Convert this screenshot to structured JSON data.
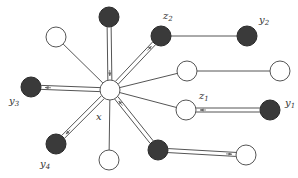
{
  "diagram": {
    "type": "graph",
    "colors": {
      "filled_node": "#3a3a3a",
      "empty_node_fill": "#ffffff",
      "stroke": "#555555",
      "arrow": "#666666"
    },
    "nodes": [
      {
        "id": "x",
        "label": "x",
        "filled": false,
        "cx": 110,
        "cy": 90
      },
      {
        "id": "top-left",
        "label": "",
        "filled": false,
        "cx": 56,
        "cy": 37
      },
      {
        "id": "top",
        "label": "",
        "filled": true,
        "cx": 109,
        "cy": 17
      },
      {
        "id": "z2",
        "label": "z2",
        "filled": true,
        "cx": 161,
        "cy": 36
      },
      {
        "id": "y2",
        "label": "y2",
        "filled": true,
        "cx": 247,
        "cy": 36
      },
      {
        "id": "mid-right",
        "label": "",
        "filled": false,
        "cx": 187,
        "cy": 71
      },
      {
        "id": "far-right",
        "label": "",
        "filled": false,
        "cx": 280,
        "cy": 71
      },
      {
        "id": "z1",
        "label": "z1",
        "filled": false,
        "cx": 186,
        "cy": 110
      },
      {
        "id": "y1",
        "label": "y1",
        "filled": true,
        "cx": 270,
        "cy": 110
      },
      {
        "id": "y3",
        "label": "y3",
        "filled": true,
        "cx": 31,
        "cy": 87
      },
      {
        "id": "y4",
        "label": "y4",
        "filled": true,
        "cx": 56,
        "cy": 144
      },
      {
        "id": "bottom",
        "label": "",
        "filled": false,
        "cx": 109,
        "cy": 160
      },
      {
        "id": "bottom-right",
        "label": "",
        "filled": true,
        "cx": 158,
        "cy": 150
      },
      {
        "id": "bottom-far",
        "label": "",
        "filled": false,
        "cx": 246,
        "cy": 155
      }
    ],
    "edges": [
      {
        "from": "x",
        "to": "top-left",
        "double": false
      },
      {
        "from": "top",
        "to": "x",
        "double": true,
        "arrow": "to-x"
      },
      {
        "from": "x",
        "to": "z2",
        "double": true,
        "arrow": "to-z2"
      },
      {
        "from": "z2",
        "to": "y2",
        "double": false
      },
      {
        "from": "x",
        "to": "mid-right",
        "double": false
      },
      {
        "from": "mid-right",
        "to": "far-right",
        "double": false
      },
      {
        "from": "x",
        "to": "z1",
        "double": false
      },
      {
        "from": "y1",
        "to": "z1",
        "double": true,
        "arrow": "to-z1"
      },
      {
        "from": "x",
        "to": "y3",
        "double": true,
        "arrow": "to-y3"
      },
      {
        "from": "x",
        "to": "y4",
        "double": true,
        "arrow": "to-y4"
      },
      {
        "from": "x",
        "to": "bottom",
        "double": false
      },
      {
        "from": "bottom-right",
        "to": "x",
        "double": true,
        "arrow": "to-x"
      },
      {
        "from": "bottom-right",
        "to": "bottom-far",
        "double": true,
        "arrow": "to-bottom-far"
      }
    ],
    "labels": {
      "x": "x",
      "z2": {
        "base": "z",
        "sub": "2"
      },
      "y2": {
        "base": "y",
        "sub": "2"
      },
      "z1": {
        "base": "z",
        "sub": "1"
      },
      "y1": {
        "base": "y",
        "sub": "1"
      },
      "y3": {
        "base": "y",
        "sub": "3"
      },
      "y4": {
        "base": "y",
        "sub": "4"
      }
    }
  }
}
